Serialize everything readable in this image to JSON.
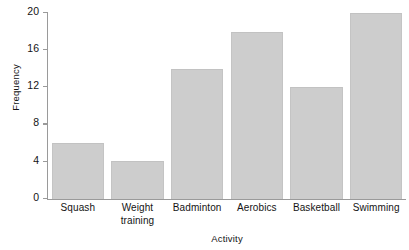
{
  "chart_data": {
    "type": "bar",
    "title": "",
    "subtitle": "",
    "xlabel": "Activity",
    "ylabel": "Frequency",
    "categories": [
      "Squash",
      "Weight training",
      "Badminton",
      "Aerobics",
      "Basketball",
      "Swimming"
    ],
    "category_lines": [
      [
        "Squash"
      ],
      [
        "Weight",
        "training"
      ],
      [
        "Badminton"
      ],
      [
        "Aerobics"
      ],
      [
        "Basketball"
      ],
      [
        "Swimming"
      ]
    ],
    "values": [
      6,
      4.1,
      14,
      18,
      12,
      20
    ],
    "ylim": [
      0,
      20
    ],
    "yticks": [
      0,
      4,
      8,
      12,
      16,
      20
    ],
    "ytick_labels": [
      "0",
      "4",
      "8",
      "12",
      "16",
      "20"
    ],
    "grid": false,
    "legend": false,
    "legend_position": "none",
    "bar_color": "#cdcdcd",
    "bar_edge_color": "#c2c2c2",
    "axis_color": "#9a9a9a",
    "text_color": "#141414",
    "background_color": "#ffffff"
  }
}
